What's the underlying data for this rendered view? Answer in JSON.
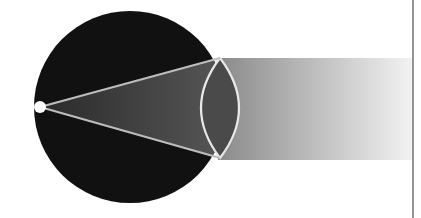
{
  "diagram": {
    "colors": {
      "background": "#ffffff",
      "eyeball": "#111111",
      "cone": "#444444",
      "lens_fill": "#4a4a4a",
      "lens_stroke": "#e8e8e8",
      "ray_lines": "#bdbdbd",
      "point": "#ffffff",
      "beam_start": "#8a8a8a",
      "beam_end": "#f2f2f2",
      "divider": "#7a7a7a"
    },
    "elements": [
      {
        "name": "eyeball",
        "shape": "circle"
      },
      {
        "name": "focal-point",
        "shape": "dot"
      },
      {
        "name": "light-cone",
        "shape": "triangle"
      },
      {
        "name": "lens",
        "shape": "biconvex"
      },
      {
        "name": "light-beam",
        "shape": "gradient-rectangle"
      },
      {
        "name": "divider-line",
        "shape": "vertical-line"
      }
    ]
  }
}
